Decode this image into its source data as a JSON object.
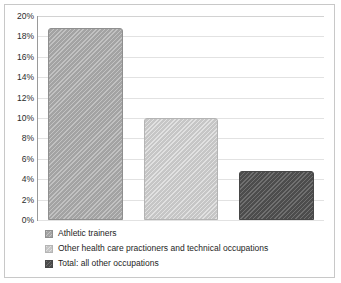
{
  "chart_data": {
    "type": "bar",
    "title": "",
    "xlabel": "",
    "ylabel": "",
    "ylim": [
      0,
      20
    ],
    "grid": true,
    "legend_position": "bottom-left",
    "categories": [
      "Athletic trainers",
      "Other health care practioners and technical occupations",
      "Total: all other occupations"
    ],
    "values": [
      18.8,
      10.0,
      4.8
    ],
    "value_labels": [
      "18.8%",
      "10.0%",
      "4.8%"
    ],
    "ytick_labels": [
      "0%",
      "2%",
      "4%",
      "6%",
      "8%",
      "10%",
      "12%",
      "14%",
      "16%",
      "18%",
      "20%"
    ],
    "ytick_values": [
      0,
      2,
      4,
      6,
      8,
      10,
      12,
      14,
      16,
      18,
      20
    ],
    "xtick_labels": [],
    "series_colors": [
      "#a8a8a8",
      "#cccccc",
      "#555555"
    ],
    "legend": [
      {
        "label": "Athletic trainers",
        "color": "#a8a8a8",
        "value": 18.8
      },
      {
        "label": "Other health care practioners and technical occupations",
        "color": "#cccccc",
        "value": 10.0
      },
      {
        "label": "Total: all other occupations",
        "color": "#555555",
        "value": 4.8
      }
    ]
  },
  "style": {
    "frame_color": "#c8c8c8",
    "axis_color": "#9a9a9a",
    "gridline_color": "#e2e2e2",
    "background": "#ffffff",
    "text_color": "#1e1e1e"
  }
}
